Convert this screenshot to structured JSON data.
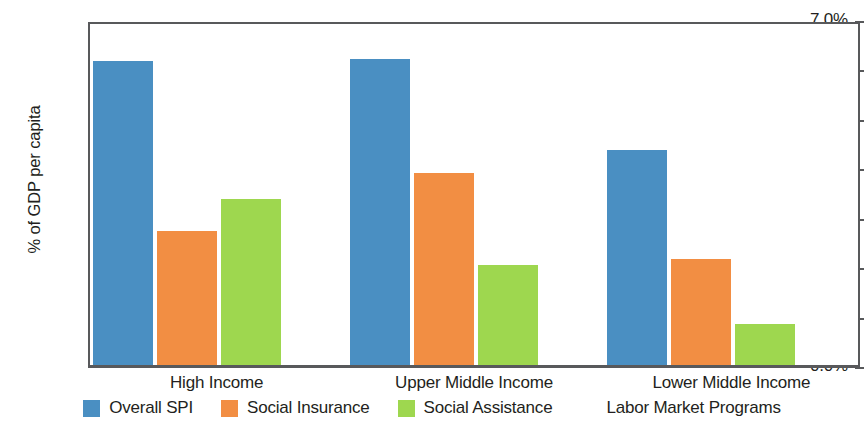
{
  "chart_data": {
    "type": "bar",
    "title": "",
    "xlabel": "",
    "ylabel": "% of GDP per capita",
    "ylim": [
      0,
      7
    ],
    "ytick_labels": [
      "7.0%",
      "6.0%",
      "5.0%",
      "4.0%",
      "3.0%",
      "2.0%",
      "1.0%",
      "0.0%"
    ],
    "ytick_values": [
      7,
      6,
      5,
      4,
      3,
      2,
      1,
      0
    ],
    "grid": false,
    "legend_position": "bottom",
    "categories": [
      "High Income",
      "Upper Middle Income",
      "Lower Middle Income"
    ],
    "series": [
      {
        "name": "Overall SPI",
        "color": "#4A8FC2",
        "values": [
          6.15,
          6.2,
          4.35
        ]
      },
      {
        "name": "Social Insurance",
        "color": "#F28E43",
        "values": [
          2.72,
          3.88,
          2.14
        ]
      },
      {
        "name": "Social Assistance",
        "color": "#9ED74F",
        "values": [
          3.36,
          2.02,
          0.83
        ]
      },
      {
        "name": "Labor Market Programs",
        "color": "#FAC council",
        "values": [
          0.0,
          0.2,
          1.3
        ]
      }
    ]
  },
  "axis": {
    "line_color": "#58595b"
  }
}
